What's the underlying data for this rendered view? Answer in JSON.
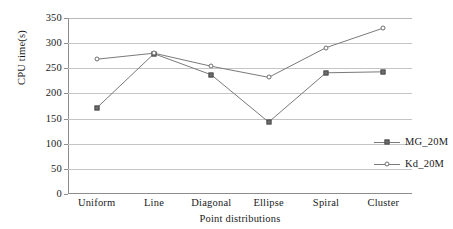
{
  "chart_data": {
    "type": "line",
    "title": "",
    "xlabel": "Point distributions",
    "ylabel": "CPU time(s)",
    "categories": [
      "Uniform",
      "Line",
      "Diagonal",
      "Ellipse",
      "Spiral",
      "Cluster"
    ],
    "ylim": [
      0,
      350
    ],
    "yticks": [
      0,
      50,
      100,
      150,
      200,
      250,
      300,
      350
    ],
    "ytick_labels": [
      "0",
      "50",
      "100",
      "150",
      "200",
      "250",
      "300",
      "350"
    ],
    "grid": true,
    "legend_position": "inside-right",
    "series": [
      {
        "name": "MG_20M",
        "marker": "filled-square",
        "color": "#6e6e6e",
        "values": [
          171,
          279,
          237,
          143,
          241,
          243
        ]
      },
      {
        "name": "Kd_20M",
        "marker": "open-circle",
        "color": "#6e6e6e",
        "values": [
          268,
          280,
          254,
          232,
          291,
          330
        ]
      }
    ]
  },
  "legend": {
    "entries": [
      {
        "label": "MG_20M"
      },
      {
        "label": "Kd_20M"
      }
    ]
  },
  "colors": {
    "line": "#7a7a7a",
    "grid": "#c5c5c5",
    "axis": "#8d8d8d",
    "text": "#1b1b1b",
    "background": "#ffffff"
  }
}
